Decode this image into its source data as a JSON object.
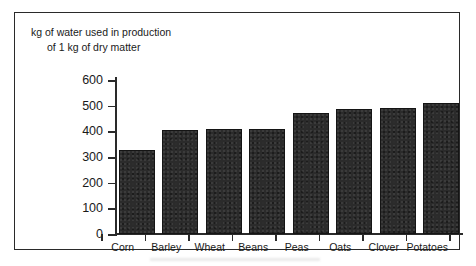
{
  "figure": {
    "title_line_1": "kg of water used in production",
    "title_line_2": "of 1 kg of dry matter"
  },
  "chart_data": {
    "type": "bar",
    "title": "kg of water used in production of 1 kg of dry matter",
    "xlabel": "",
    "ylabel": "",
    "ylim": [
      0,
      600
    ],
    "yticks": [
      0,
      100,
      200,
      300,
      400,
      500,
      600
    ],
    "ytick_labels": [
      "0",
      "100",
      "200",
      "300",
      "400",
      "500",
      "600"
    ],
    "grid": false,
    "legend": false,
    "bar_color": "#2b2b2b",
    "categories": [
      "Corn",
      "Barley",
      "Wheat",
      "Beans",
      "Peas",
      "Oats",
      "Clover",
      "Potatoes"
    ],
    "values": [
      328,
      405,
      410,
      410,
      470,
      488,
      490,
      512
    ]
  }
}
